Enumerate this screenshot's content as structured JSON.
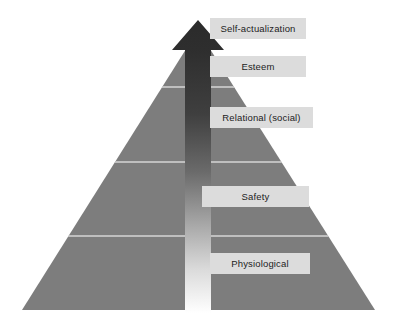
{
  "diagram": {
    "type": "pyramid",
    "background_color": "#ffffff",
    "pyramid_color": "#7d7d7d",
    "divider_color": "#d6d6d6",
    "label_box_color": "#dcdcdc",
    "label_text_color": "#1c1c1c",
    "arrow": {
      "name": "upward-growth-arrow",
      "direction": "up",
      "gradient_top_color": "#2b2b2b",
      "gradient_bottom_color": "#ffffff"
    },
    "levels": [
      {
        "index": 0,
        "label": "Self-actualization",
        "position": "apex"
      },
      {
        "index": 1,
        "label": "Esteem",
        "position": "second"
      },
      {
        "index": 2,
        "label": "Relational (social)",
        "position": "middle"
      },
      {
        "index": 3,
        "label": "Safety",
        "position": "fourth"
      },
      {
        "index": 4,
        "label": "Physiological",
        "position": "base"
      }
    ]
  }
}
